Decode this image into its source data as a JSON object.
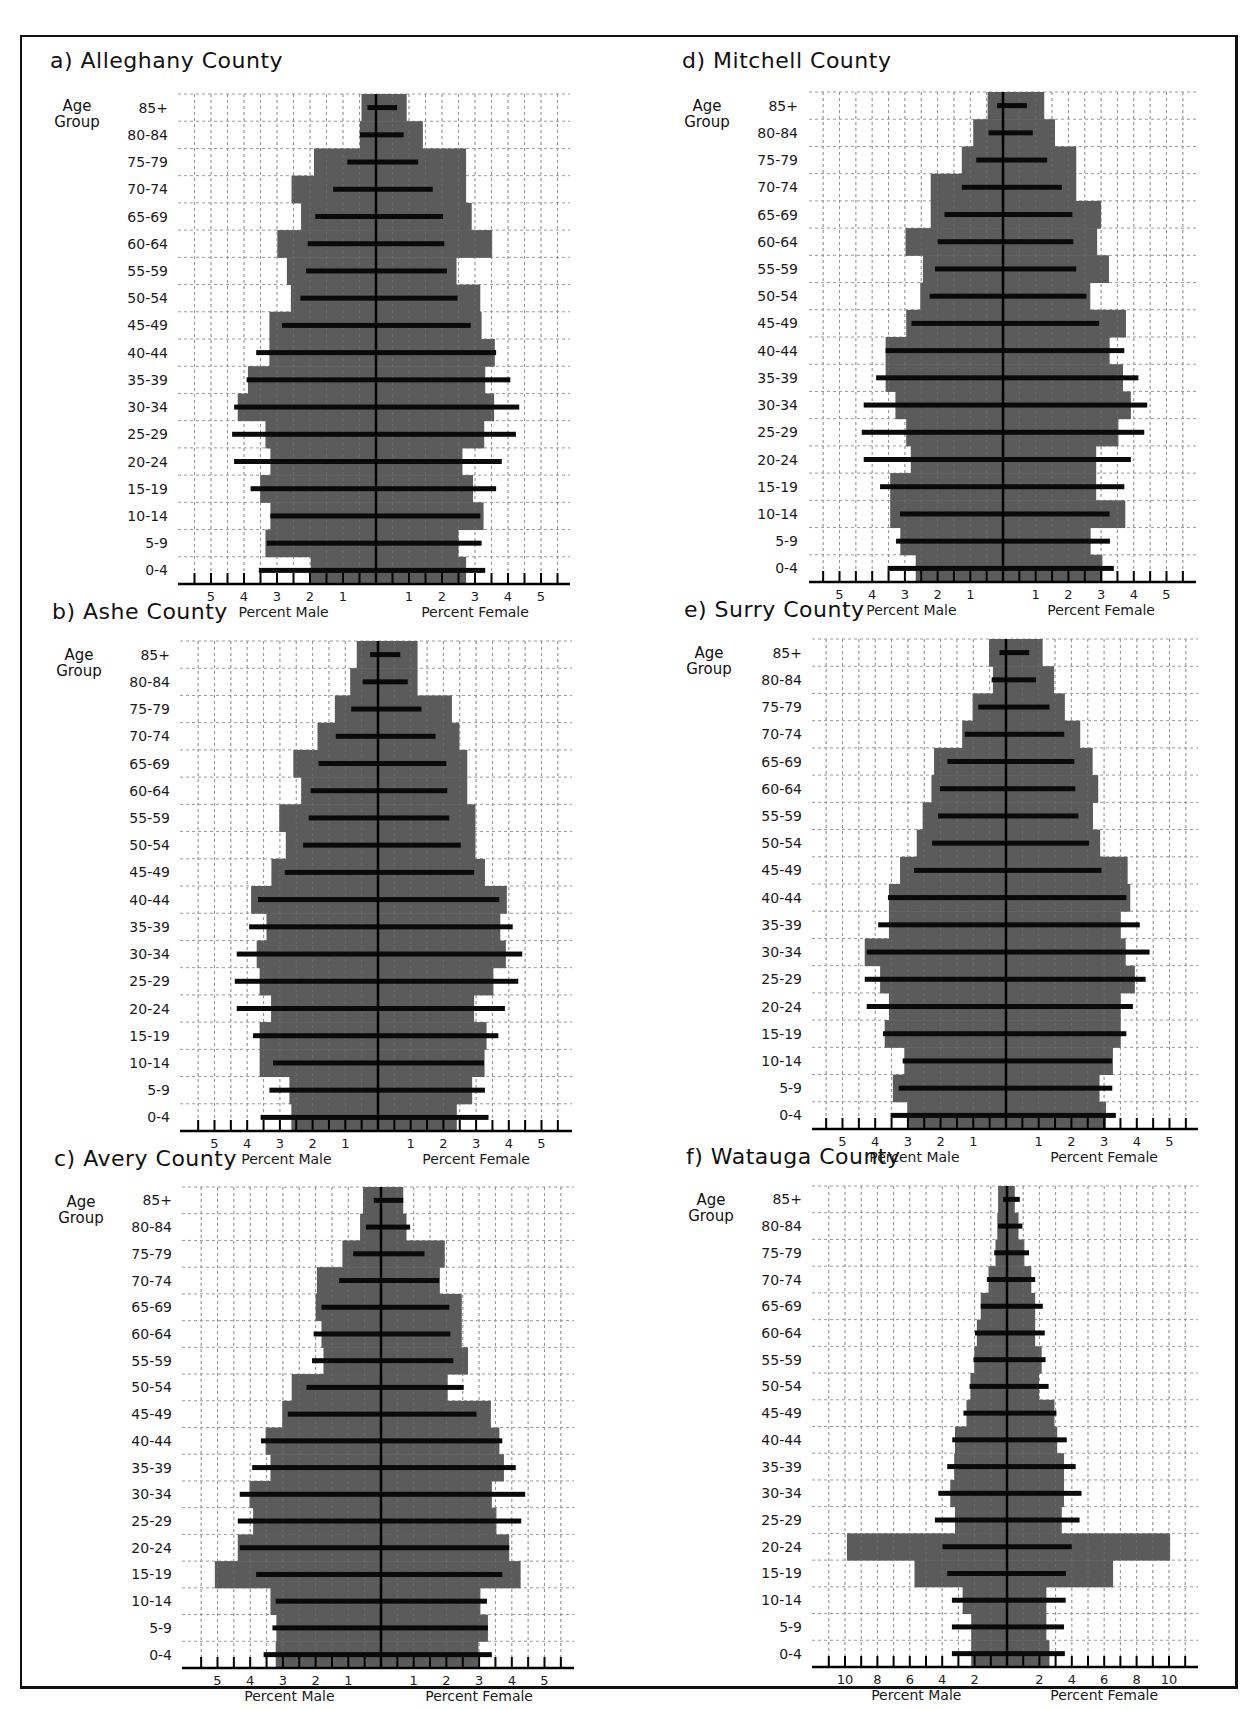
{
  "figure": {
    "age_group_caption_line1": "Age",
    "age_group_caption_line2": "Group",
    "male_axis_label": "Percent Male",
    "female_axis_label": "Percent Female",
    "colors": {
      "bar_gray": "#5b5b5b",
      "line_black": "#0a0a0a",
      "grid": "#9a9a9a",
      "frame": "#111111"
    }
  },
  "chart_data": [
    {
      "id": "a",
      "type": "bar",
      "title": "a) Alleghany County",
      "subtype": "population pyramid",
      "ylabel": "Age Group",
      "xlabel_left": "Percent Male",
      "xlabel_right": "Percent Female",
      "categories": [
        "85+",
        "80-84",
        "75-79",
        "70-74",
        "65-69",
        "60-64",
        "55-59",
        "50-54",
        "45-49",
        "40-44",
        "35-39",
        "30-34",
        "25-29",
        "20-24",
        "15-19",
        "10-14",
        "5-9",
        "0-4"
      ],
      "x_ticks_labels": [
        5,
        4,
        3,
        2,
        1,
        1,
        2,
        3,
        4,
        5
      ],
      "xlim": [
        -5.5,
        5.5
      ],
      "series": [
        {
          "name": "shaded bars",
          "style": "gray-bar",
          "male": [
            0.44,
            0.49,
            1.88,
            2.56,
            2.27,
            2.99,
            2.7,
            2.58,
            3.23,
            3.23,
            3.88,
            4.19,
            3.35,
            3.2,
            3.51,
            3.2,
            3.35,
            1.98
          ],
          "female": [
            0.93,
            1.42,
            2.73,
            2.73,
            2.9,
            3.52,
            2.44,
            3.16,
            3.2,
            3.6,
            3.31,
            3.58,
            3.28,
            2.62,
            2.94,
            3.26,
            2.5,
            2.73
          ]
        },
        {
          "name": "black lines",
          "style": "black-line",
          "male": [
            0.26,
            0.49,
            0.87,
            1.3,
            1.84,
            2.07,
            2.12,
            2.29,
            2.85,
            3.63,
            3.92,
            4.3,
            4.36,
            4.3,
            3.8,
            3.2,
            3.31,
            3.55
          ],
          "female": [
            0.64,
            0.84,
            1.28,
            1.72,
            2.03,
            2.07,
            2.15,
            2.47,
            2.87,
            3.64,
            4.07,
            4.34,
            4.24,
            3.81,
            3.64,
            3.16,
            3.2,
            3.31
          ]
        }
      ],
      "grid": true
    },
    {
      "id": "b",
      "type": "bar",
      "title": "b) Ashe County",
      "subtype": "population pyramid",
      "ylabel": "Age Group",
      "xlabel_left": "Percent Male",
      "xlabel_right": "Percent Female",
      "categories": [
        "85+",
        "80-84",
        "75-79",
        "70-74",
        "65-69",
        "60-64",
        "55-59",
        "50-54",
        "45-49",
        "40-44",
        "35-39",
        "30-34",
        "25-29",
        "20-24",
        "15-19",
        "10-14",
        "5-9",
        "0-4"
      ],
      "x_ticks_labels": [
        5,
        4,
        3,
        2,
        1,
        1,
        2,
        3,
        4,
        5
      ],
      "xlim": [
        -5.5,
        5.5
      ],
      "series": [
        {
          "name": "shaded bars",
          "style": "gray-bar",
          "male": [
            0.65,
            0.85,
            1.32,
            1.85,
            2.59,
            2.35,
            3.02,
            2.82,
            3.26,
            3.88,
            3.41,
            3.71,
            3.62,
            3.27,
            3.62,
            3.62,
            2.71,
            2.65
          ],
          "female": [
            1.21,
            1.21,
            2.26,
            2.49,
            2.73,
            2.73,
            2.98,
            2.98,
            3.27,
            3.94,
            3.74,
            3.91,
            3.53,
            2.94,
            3.32,
            3.26,
            2.88,
            2.41
          ]
        },
        {
          "name": "black lines",
          "style": "black-line",
          "male": [
            0.24,
            0.47,
            0.82,
            1.29,
            1.82,
            2.06,
            2.12,
            2.29,
            2.85,
            3.67,
            3.94,
            4.32,
            4.38,
            4.32,
            3.82,
            3.21,
            3.32,
            3.59
          ],
          "female": [
            0.68,
            0.91,
            1.33,
            1.76,
            2.09,
            2.12,
            2.18,
            2.53,
            2.94,
            3.71,
            4.12,
            4.41,
            4.29,
            3.88,
            3.68,
            3.24,
            3.27,
            3.38
          ]
        }
      ],
      "grid": true
    },
    {
      "id": "c",
      "type": "bar",
      "title": "c) Avery County",
      "subtype": "population pyramid",
      "ylabel": "Age Group",
      "xlabel_left": "Percent Male",
      "xlabel_right": "Percent Female",
      "categories": [
        "85+",
        "80-84",
        "75-79",
        "70-74",
        "65-69",
        "60-64",
        "55-59",
        "50-54",
        "45-49",
        "40-44",
        "35-39",
        "30-34",
        "25-29",
        "20-24",
        "15-19",
        "10-14",
        "5-9",
        "0-4"
      ],
      "x_ticks_labels": [
        5,
        4,
        3,
        2,
        1,
        1,
        2,
        3,
        4,
        5
      ],
      "xlim": [
        -5.5,
        5.5
      ],
      "series": [
        {
          "name": "shaded bars",
          "style": "gray-bar",
          "male": [
            0.55,
            0.64,
            1.18,
            1.96,
            2.0,
            1.82,
            1.76,
            2.73,
            3.02,
            3.53,
            3.38,
            4.02,
            3.91,
            4.38,
            5.08,
            3.38,
            3.2,
            3.22
          ],
          "female": [
            0.68,
            0.78,
            1.95,
            1.8,
            2.47,
            2.47,
            2.66,
            2.04,
            3.36,
            3.62,
            3.76,
            3.39,
            3.53,
            3.92,
            4.27,
            3.04,
            3.27,
            2.98
          ]
        },
        {
          "name": "black lines",
          "style": "black-line",
          "male": [
            0.22,
            0.46,
            0.85,
            1.28,
            1.82,
            2.06,
            2.11,
            2.28,
            2.85,
            3.67,
            3.94,
            4.32,
            4.38,
            4.32,
            3.82,
            3.22,
            3.32,
            3.59
          ],
          "female": [
            0.68,
            0.89,
            1.33,
            1.78,
            2.09,
            2.12,
            2.21,
            2.53,
            2.92,
            3.71,
            4.12,
            4.41,
            4.29,
            3.92,
            3.71,
            3.24,
            3.27,
            3.39
          ]
        }
      ],
      "grid": true
    },
    {
      "id": "d",
      "type": "bar",
      "title": "d) Mitchell County",
      "subtype": "population pyramid",
      "ylabel": "Age Group",
      "xlabel_left": "Percent Male",
      "xlabel_right": "Percent Female",
      "categories": [
        "85+",
        "80-84",
        "75-79",
        "70-74",
        "65-69",
        "60-64",
        "55-59",
        "50-54",
        "45-49",
        "40-44",
        "35-39",
        "30-34",
        "25-29",
        "20-24",
        "15-19",
        "10-14",
        "5-9",
        "0-4"
      ],
      "x_ticks_labels": [
        5,
        4,
        3,
        2,
        1,
        1,
        2,
        3,
        4,
        5
      ],
      "xlim": [
        -5.5,
        5.5
      ],
      "series": [
        {
          "name": "shaded bars",
          "style": "gray-bar",
          "male": [
            0.47,
            0.91,
            1.26,
            2.21,
            2.21,
            2.98,
            2.45,
            2.53,
            2.96,
            3.59,
            3.59,
            3.29,
            2.96,
            2.82,
            3.45,
            3.45,
            3.14,
            2.67
          ],
          "female": [
            1.26,
            1.59,
            2.24,
            2.24,
            3.0,
            2.88,
            3.24,
            2.67,
            3.76,
            3.26,
            3.67,
            3.91,
            3.53,
            2.85,
            2.85,
            3.74,
            2.68,
            3.04
          ]
        },
        {
          "name": "black lines",
          "style": "black-line",
          "male": [
            0.18,
            0.44,
            0.82,
            1.26,
            1.79,
            2.0,
            2.08,
            2.24,
            2.8,
            3.59,
            3.88,
            4.26,
            4.32,
            4.26,
            3.76,
            3.15,
            3.27,
            3.53
          ],
          "female": [
            0.73,
            0.91,
            1.35,
            1.8,
            2.12,
            2.15,
            2.24,
            2.55,
            2.94,
            3.71,
            4.14,
            4.41,
            4.32,
            3.91,
            3.71,
            3.26,
            3.27,
            3.39
          ]
        }
      ],
      "grid": true
    },
    {
      "id": "e",
      "type": "bar",
      "title": "e) Surry County",
      "subtype": "population pyramid",
      "ylabel": "Age Group",
      "xlabel_left": "Percent Male",
      "xlabel_right": "Percent Female",
      "categories": [
        "85+",
        "80-84",
        "75-79",
        "70-74",
        "65-69",
        "60-64",
        "55-59",
        "50-54",
        "45-49",
        "40-44",
        "35-39",
        "30-34",
        "25-29",
        "20-24",
        "15-19",
        "10-14",
        "5-9",
        "0-4"
      ],
      "x_ticks_labels": [
        5,
        4,
        3,
        2,
        1,
        1,
        2,
        3,
        4,
        5
      ],
      "xlim": [
        -5.5,
        5.5
      ],
      "series": [
        {
          "name": "shaded bars",
          "style": "gray-bar",
          "male": [
            0.52,
            0.4,
            1.02,
            1.34,
            2.2,
            2.28,
            2.55,
            2.73,
            3.24,
            3.58,
            3.58,
            4.32,
            3.85,
            3.58,
            3.71,
            3.11,
            3.46,
            3.02
          ],
          "female": [
            1.12,
            1.47,
            1.8,
            2.27,
            2.65,
            2.82,
            2.66,
            2.88,
            3.72,
            3.8,
            3.51,
            3.66,
            3.94,
            3.51,
            3.51,
            3.27,
            2.86,
            3.06
          ]
        },
        {
          "name": "black lines",
          "style": "black-line",
          "male": [
            0.2,
            0.44,
            0.85,
            1.26,
            1.79,
            2.02,
            2.08,
            2.26,
            2.81,
            3.61,
            3.91,
            4.26,
            4.32,
            4.26,
            3.76,
            3.16,
            3.28,
            3.53
          ],
          "female": [
            0.71,
            0.92,
            1.33,
            1.78,
            2.09,
            2.12,
            2.21,
            2.54,
            2.92,
            3.68,
            4.09,
            4.39,
            4.27,
            3.88,
            3.68,
            3.24,
            3.25,
            3.36
          ]
        }
      ],
      "grid": true
    },
    {
      "id": "f",
      "type": "bar",
      "title": "f) Watauga County",
      "subtype": "population pyramid",
      "ylabel": "Age Group",
      "xlabel_left": "Percent Male",
      "xlabel_right": "Percent Female",
      "categories": [
        "85+",
        "80-84",
        "75-79",
        "70-74",
        "65-69",
        "60-64",
        "55-59",
        "50-54",
        "45-49",
        "40-44",
        "35-39",
        "30-34",
        "25-29",
        "20-24",
        "15-19",
        "10-14",
        "5-9",
        "0-4"
      ],
      "x_ticks_labels": [
        10,
        8,
        6,
        4,
        2,
        2,
        4,
        6,
        8,
        10
      ],
      "xlim": [
        -11,
        11
      ],
      "series": [
        {
          "name": "shaded bars",
          "style": "gray-bar",
          "male": [
            0.55,
            0.6,
            0.71,
            1.14,
            1.62,
            1.86,
            2.02,
            2.26,
            2.5,
            3.21,
            3.26,
            3.5,
            3.21,
            9.88,
            5.71,
            2.74,
            2.21,
            2.21
          ],
          "female": [
            0.48,
            0.71,
            1.07,
            1.5,
            1.74,
            1.74,
            2.14,
            1.98,
            2.93,
            3.1,
            3.52,
            3.52,
            3.38,
            10.07,
            6.55,
            2.43,
            2.43,
            2.62
          ]
        },
        {
          "name": "black lines",
          "style": "black-line",
          "male": [
            0.24,
            0.55,
            0.79,
            1.24,
            1.62,
            1.98,
            2.07,
            2.31,
            2.69,
            3.38,
            3.69,
            4.24,
            4.45,
            3.98,
            3.69,
            3.4,
            3.4,
            3.4
          ],
          "female": [
            0.79,
            0.95,
            1.36,
            1.74,
            2.21,
            2.33,
            2.38,
            2.57,
            3.05,
            3.69,
            4.24,
            4.6,
            4.48,
            4.0,
            3.64,
            3.62,
            3.52,
            3.57
          ]
        }
      ],
      "grid": true
    }
  ]
}
